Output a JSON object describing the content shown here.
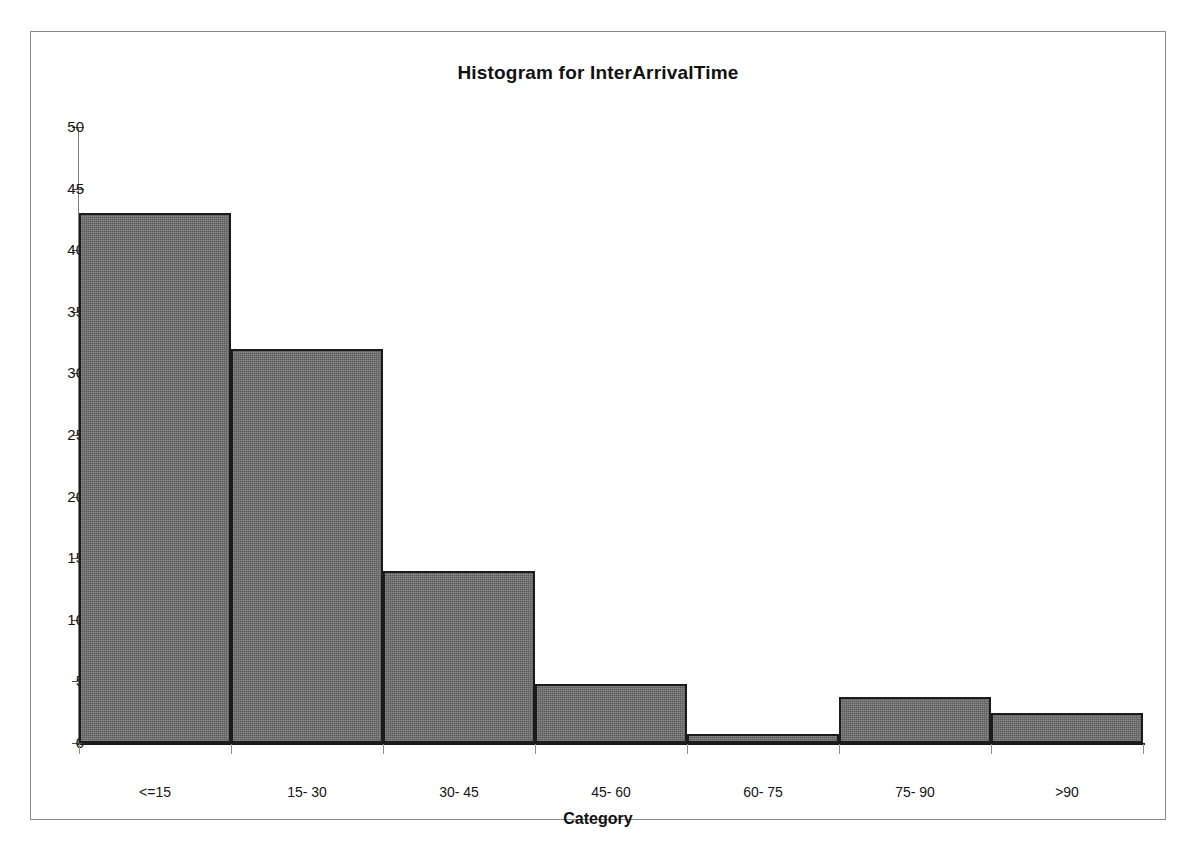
{
  "chart_data": {
    "type": "bar",
    "title": "Histogram for InterArrivalTime",
    "xlabel": "Category",
    "ylabel": "",
    "categories": [
      "<=15",
      "15- 30",
      "30- 45",
      "45- 60",
      "60- 75",
      "75- 90",
      ">90"
    ],
    "values": [
      43,
      32,
      14,
      4.8,
      0.7,
      3.7,
      2.4
    ],
    "ylim": [
      0,
      50
    ],
    "yticks": [
      0,
      5,
      10,
      15,
      20,
      25,
      30,
      35,
      40,
      45,
      50
    ],
    "ytick_labels": [
      "0",
      "5",
      "10",
      "15",
      "20",
      "25",
      "30",
      "35",
      "40",
      "45",
      "50"
    ],
    "grid": false,
    "legend": false,
    "bar_fill_color": "#6f6f6f",
    "bar_edge_color": "#1b1b1b",
    "axis_color": "#1a1a1a",
    "background_color": "#ffffff"
  }
}
